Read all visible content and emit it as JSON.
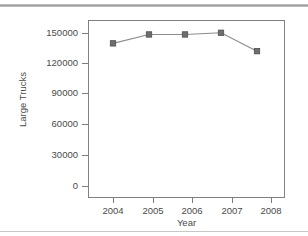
{
  "chart_data": {
    "type": "line",
    "title": "",
    "xlabel": "Year",
    "ylabel": "Large Trucks",
    "categories": [
      "2004",
      "2005",
      "2006",
      "2007",
      "2008"
    ],
    "x": [
      2004,
      2005,
      2006,
      2007,
      2008
    ],
    "values": [
      139000,
      147000,
      147000,
      148500,
      132000
    ],
    "series": [
      {
        "name": "Large Trucks",
        "values": [
          139000,
          147000,
          147000,
          148500,
          132000
        ]
      }
    ],
    "ylim": [
      0,
      160000
    ],
    "yticks": [
      0,
      30000,
      60000,
      90000,
      120000,
      150000
    ],
    "ytick_labels": [
      "0",
      "30000",
      "60000",
      "90000",
      "120000",
      "150000"
    ],
    "xticks": [
      2004,
      2005,
      2006,
      2007,
      2008
    ],
    "xtick_labels": [
      "2004",
      "2005",
      "2006",
      "2007",
      "2008"
    ],
    "grid": false,
    "legend": false,
    "legend_position": "none",
    "marker": "square",
    "colors": {
      "line": "#8c8c8c",
      "marker": "#6e6e6e",
      "marker_edge": "#4f4f4f",
      "axis": "#808080",
      "text": "#4a4a4a",
      "background": "#ffffff"
    }
  }
}
